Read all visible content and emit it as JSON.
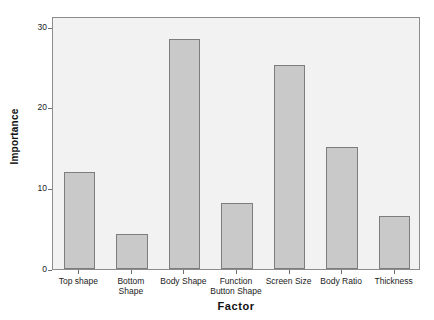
{
  "chart_data": {
    "type": "bar",
    "title": "",
    "xlabel": "Factor",
    "ylabel": "Importance",
    "categories": [
      "Top shape",
      "Bottom Shape",
      "Body Shape",
      "Function\nButton Shape",
      "Screen Size",
      "Body Ratio",
      "Thickness"
    ],
    "values": [
      12.0,
      4.3,
      28.4,
      8.2,
      25.2,
      15.1,
      6.5
    ],
    "ylim": [
      0,
      31.3
    ],
    "yticks": [
      0,
      10,
      20,
      30
    ],
    "ytick_labels": [
      "0",
      "10",
      "20",
      "30"
    ],
    "grid": false,
    "legend": "none",
    "bar_fill": "#c9c9c9",
    "bar_border": "#7d7d7d",
    "plot_background": "#f2f2f2",
    "plot_border": "#8c8c8c",
    "figure_background": "#ffffff"
  }
}
